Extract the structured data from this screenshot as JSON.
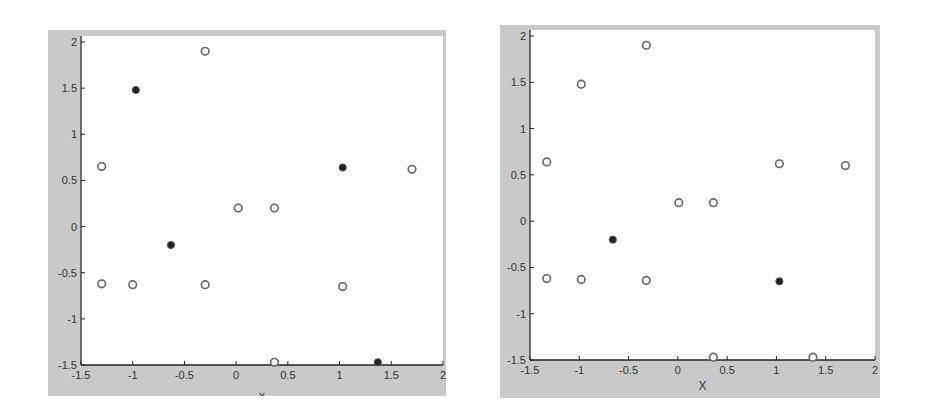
{
  "chart_data": [
    {
      "type": "scatter",
      "title": "",
      "xlabel": "x",
      "ylabel": "",
      "xlim": [
        -1.5,
        2
      ],
      "ylim": [
        -1.5,
        2
      ],
      "x_ticks": [
        "-1.5",
        "-1",
        "-0.5",
        "0",
        "0.5",
        "1",
        "1.5",
        "2"
      ],
      "y_ticks": [
        "2",
        "1.5",
        "1",
        "0.5",
        "0",
        "-0.5",
        "-1",
        "-1.5"
      ],
      "grid": false,
      "series": [
        {
          "name": "open",
          "marker": "open-circle",
          "points": [
            {
              "x": -0.3,
              "y": 1.9
            },
            {
              "x": -1.3,
              "y": 0.65
            },
            {
              "x": -1.3,
              "y": -0.62
            },
            {
              "x": -1.0,
              "y": -0.63
            },
            {
              "x": -0.3,
              "y": -0.63
            },
            {
              "x": 0.02,
              "y": 0.2
            },
            {
              "x": 0.37,
              "y": 0.2
            },
            {
              "x": 1.03,
              "y": -0.65
            },
            {
              "x": 1.7,
              "y": 0.62
            },
            {
              "x": 0.37,
              "y": -1.47
            }
          ]
        },
        {
          "name": "filled",
          "marker": "filled-circle",
          "points": [
            {
              "x": -0.97,
              "y": 1.48
            },
            {
              "x": -0.63,
              "y": -0.2
            },
            {
              "x": 1.03,
              "y": 0.64
            },
            {
              "x": 1.37,
              "y": -1.47
            }
          ]
        }
      ]
    },
    {
      "type": "scatter",
      "title": "",
      "xlabel": "X",
      "ylabel": "",
      "xlim": [
        -1.5,
        2
      ],
      "ylim": [
        -1.5,
        2
      ],
      "x_ticks": [
        "-1.5",
        "-1",
        "-0.5",
        "0",
        "0.5",
        "1",
        "1.5",
        "2"
      ],
      "y_ticks": [
        "2",
        "1.5",
        "1",
        "0.5",
        "0",
        "-0.5",
        "-1",
        "-1.5"
      ],
      "grid": false,
      "series": [
        {
          "name": "open",
          "marker": "open-circle",
          "points": [
            {
              "x": -0.32,
              "y": 1.9
            },
            {
              "x": -0.98,
              "y": 1.48
            },
            {
              "x": -1.33,
              "y": 0.64
            },
            {
              "x": -1.33,
              "y": -0.62
            },
            {
              "x": -0.98,
              "y": -0.63
            },
            {
              "x": -0.32,
              "y": -0.64
            },
            {
              "x": 0.01,
              "y": 0.2
            },
            {
              "x": 0.36,
              "y": 0.2
            },
            {
              "x": 1.03,
              "y": 0.62
            },
            {
              "x": 1.7,
              "y": 0.6
            },
            {
              "x": 0.36,
              "y": -1.47
            },
            {
              "x": 1.37,
              "y": -1.47
            }
          ]
        },
        {
          "name": "filled",
          "marker": "filled-circle",
          "points": [
            {
              "x": -0.66,
              "y": -0.2
            },
            {
              "x": 1.03,
              "y": -0.65
            }
          ]
        }
      ]
    }
  ],
  "panels": [
    {
      "box": {
        "left": 48,
        "top": 30,
        "width": 398,
        "height": 366
      },
      "axes": {
        "x0": 81,
        "x1": 443,
        "y0": 42,
        "y1": 365
      },
      "xlabel_visible": "x",
      "xlabel_clipped": true
    },
    {
      "box": {
        "left": 500,
        "top": 25,
        "width": 380,
        "height": 373
      },
      "axes": {
        "x0": 530,
        "x1": 875,
        "y0": 36,
        "y1": 360
      },
      "xlabel_visible": "X",
      "xlabel_clipped": false
    }
  ],
  "colors": {
    "frame_gray": "#c9c9c9",
    "axes_bg": "#ffffff",
    "axis_line": "#222222",
    "marker_open_stroke": "#666666",
    "marker_filled": "#222222"
  }
}
